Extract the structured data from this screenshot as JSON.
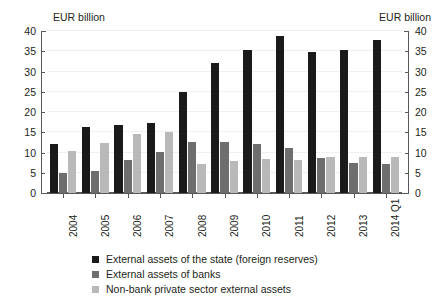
{
  "chart_data": {
    "type": "bar",
    "title": "",
    "subtitle": "",
    "xlabel": "",
    "ylabel": "EUR billion",
    "ylabel_right": "EUR billion",
    "ylim": [
      0,
      40
    ],
    "ytick_step": 5,
    "yticks": [
      0,
      5,
      10,
      15,
      20,
      25,
      30,
      35,
      40
    ],
    "ytick_labels": [
      "0",
      "5",
      "10",
      "15",
      "20",
      "25",
      "30",
      "35",
      "40"
    ],
    "grid": true,
    "grid_axis": "y",
    "legend_position": "bottom",
    "categories": [
      "2004",
      "2005",
      "2006",
      "2007",
      "2008",
      "2009",
      "2010",
      "2011",
      "2012",
      "2013",
      "2014 Q1"
    ],
    "series": [
      {
        "name": "External assets of the state (foreign reserves)",
        "color": "#1a1a1a",
        "values": [
          12.2,
          16.2,
          16.7,
          17.4,
          24.9,
          32.2,
          35.3,
          38.8,
          34.9,
          35.2,
          37.9
        ]
      },
      {
        "name": "External assets of banks",
        "color": "#6e6e6e",
        "values": [
          4.9,
          5.5,
          8.1,
          10.2,
          12.6,
          12.7,
          12.2,
          11.0,
          8.6,
          7.5,
          7.2
        ]
      },
      {
        "name": "Non-bank private sector external assets",
        "color": "#b9b9b9",
        "values": [
          10.3,
          12.4,
          14.5,
          15.1,
          7.1,
          7.8,
          8.5,
          8.2,
          8.8,
          8.8,
          8.9
        ]
      }
    ]
  }
}
